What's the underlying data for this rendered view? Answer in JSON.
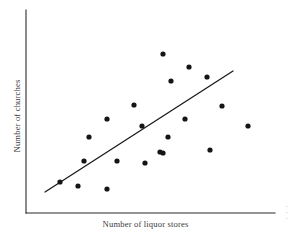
{
  "chart_data": {
    "type": "scatter",
    "title": "",
    "xlabel": "Number of liquor stores",
    "ylabel": "Number of churches",
    "xlim": [
      0,
      100
    ],
    "ylim": [
      0,
      100
    ],
    "grid": false,
    "legend": null,
    "tick_labels": {
      "x": [],
      "y": []
    },
    "axes_style": "L-shaped spine, no ticks, no tick labels",
    "point_marker": "filled-circle",
    "point_color": "#151515",
    "axis_color": "#2b2b2b",
    "line_color": "#1a1a1a",
    "n_points": 21,
    "points": [
      {
        "px": 163,
        "py": 54,
        "x": 55.0,
        "y": 78.3
      },
      {
        "px": 189,
        "py": 67,
        "x": 65.5,
        "y": 71.9
      },
      {
        "px": 171,
        "py": 81,
        "x": 58.2,
        "y": 65.0
      },
      {
        "px": 207,
        "py": 77,
        "x": 72.7,
        "y": 67.0
      },
      {
        "px": 134,
        "py": 105,
        "x": 43.4,
        "y": 53.2
      },
      {
        "px": 107,
        "py": 119,
        "x": 32.5,
        "y": 46.3
      },
      {
        "px": 142,
        "py": 126,
        "x": 46.6,
        "y": 42.9
      },
      {
        "px": 222,
        "py": 106,
        "x": 78.7,
        "y": 52.7
      },
      {
        "px": 168,
        "py": 137,
        "x": 57.0,
        "y": 37.4
      },
      {
        "px": 185,
        "py": 119,
        "x": 63.9,
        "y": 46.3
      },
      {
        "px": 89,
        "py": 137,
        "x": 25.3,
        "y": 37.4
      },
      {
        "px": 160,
        "py": 152,
        "x": 53.8,
        "y": 30.0
      },
      {
        "px": 210,
        "py": 150,
        "x": 73.9,
        "y": 31.0
      },
      {
        "px": 163,
        "py": 153,
        "x": 55.0,
        "y": 29.6
      },
      {
        "px": 84,
        "py": 161,
        "x": 23.3,
        "y": 25.6
      },
      {
        "px": 117,
        "py": 161,
        "x": 36.5,
        "y": 25.6
      },
      {
        "px": 145,
        "py": 163,
        "x": 47.8,
        "y": 24.6
      },
      {
        "px": 248,
        "py": 126,
        "x": 89.2,
        "y": 42.9
      },
      {
        "px": 60,
        "py": 182,
        "x": 13.7,
        "y": 15.3
      },
      {
        "px": 78,
        "py": 186,
        "x": 20.9,
        "y": 13.3
      },
      {
        "px": 107,
        "py": 189,
        "x": 32.5,
        "y": 11.8
      }
    ],
    "trend_line": {
      "label": "regression line",
      "px1": 45,
      "py1": 192,
      "px2": 233,
      "py2": 71,
      "x1": 7.6,
      "y1": 10.3,
      "x2": 83.1,
      "y2": 70.0
    },
    "axis_geometry": {
      "y_axis_px_x": 26,
      "y_axis_px_top": 10,
      "x_axis_px_y": 213,
      "x_axis_px_right": 275
    },
    "annotations": []
  },
  "labels": {
    "x_axis": "Number of liquor stores",
    "y_axis": "Number of churches"
  }
}
